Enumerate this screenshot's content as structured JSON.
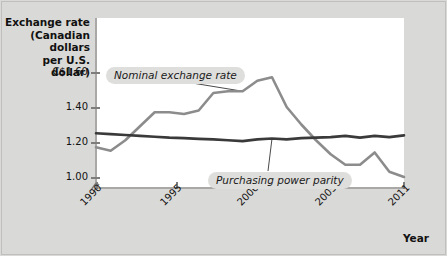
{
  "chart_data": {
    "type": "line",
    "title": "",
    "ylabel": "Exchange rate\n(Canadian dollars\nper U.S. dollar)",
    "xlabel": "Year",
    "ylim": [
      0.95,
      1.66
    ],
    "xlim": [
      1990,
      2011
    ],
    "grid": false,
    "axis_break": true,
    "ytick_labels": [
      "C$1.60",
      "1.40",
      "1.20",
      "1.00"
    ],
    "ytick_values": [
      1.6,
      1.4,
      1.2,
      1.0
    ],
    "xtick_labels": [
      "1990",
      "1995",
      "2000",
      "2005",
      "2011"
    ],
    "xtick_values": [
      1990,
      1995,
      2000,
      2005,
      2011
    ],
    "x": [
      1990,
      1991,
      1992,
      1993,
      1994,
      1995,
      1996,
      1997,
      1998,
      1999,
      2000,
      2001,
      2002,
      2003,
      2004,
      2005,
      2006,
      2007,
      2008,
      2009,
      2010,
      2011
    ],
    "series": [
      {
        "name": "Nominal exchange rate",
        "color": "#8c8c8c",
        "values": [
          1.17,
          1.15,
          1.21,
          1.29,
          1.37,
          1.37,
          1.36,
          1.38,
          1.48,
          1.49,
          1.49,
          1.55,
          1.57,
          1.4,
          1.3,
          1.21,
          1.13,
          1.07,
          1.07,
          1.14,
          1.03,
          1.0
        ]
      },
      {
        "name": "Purchasing power parity",
        "color": "#3a3a3a",
        "values": [
          1.25,
          1.245,
          1.24,
          1.235,
          1.23,
          1.225,
          1.222,
          1.218,
          1.215,
          1.21,
          1.205,
          1.215,
          1.22,
          1.215,
          1.222,
          1.225,
          1.228,
          1.235,
          1.225,
          1.235,
          1.228,
          1.238
        ]
      }
    ],
    "annotations": [
      {
        "text": "Nominal exchange rate",
        "points_to_year": 2000,
        "points_to_value": 1.49
      },
      {
        "text": "Purchasing power parity",
        "points_to_year": 2002,
        "points_to_value": 1.22
      }
    ]
  }
}
